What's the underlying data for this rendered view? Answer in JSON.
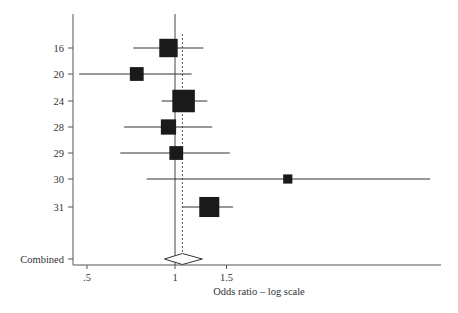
{
  "chart_data": {
    "type": "forest",
    "title": "",
    "xlabel": "Odds ratio – log scale",
    "ylabel": "",
    "x_scale": "log",
    "x_ticks": [
      {
        "value": 0.5,
        "label": ".5"
      },
      {
        "value": 1,
        "label": "1"
      },
      {
        "value": 1.5,
        "label": "1.5"
      }
    ],
    "reference_line": 1,
    "pooled_line": 1.06,
    "studies": [
      {
        "label": "16",
        "or": 0.95,
        "lower": 0.72,
        "upper": 1.25,
        "weight": 16
      },
      {
        "label": "20",
        "or": 0.74,
        "lower": 0.47,
        "upper": 1.14,
        "weight": 9
      },
      {
        "label": "24",
        "or": 1.07,
        "lower": 0.9,
        "upper": 1.29,
        "weight": 24
      },
      {
        "label": "28",
        "or": 0.95,
        "lower": 0.67,
        "upper": 1.34,
        "weight": 11
      },
      {
        "label": "29",
        "or": 1.01,
        "lower": 0.65,
        "upper": 1.54,
        "weight": 9
      },
      {
        "label": "30",
        "or": 2.43,
        "lower": 0.8,
        "upper": 7.45,
        "weight": 4
      },
      {
        "label": "31",
        "or": 1.31,
        "lower": 1.06,
        "upper": 1.58,
        "weight": 19
      }
    ],
    "combined": {
      "label": "Combined",
      "or": 1.06,
      "lower": 0.92,
      "upper": 1.24
    },
    "grid": false,
    "legend": "none"
  },
  "colors": {
    "ink": "#1a1a1a",
    "axis": "#555555",
    "background": "#ffffff"
  }
}
